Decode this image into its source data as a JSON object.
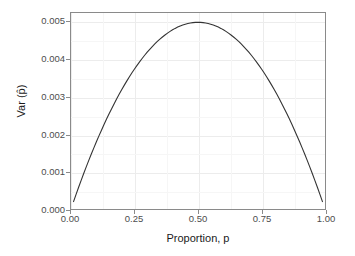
{
  "chart_data": {
    "type": "line",
    "title": "",
    "subtitle": "",
    "xlabel": "Proportion, p",
    "ylabel": "Var (p̂)",
    "xlim": [
      0.0,
      1.0
    ],
    "ylim": [
      0.0,
      0.00525
    ],
    "xticks": [
      0.0,
      0.25,
      0.5,
      0.75,
      1.0
    ],
    "xticklabels": [
      "0.00",
      "0.25",
      "0.50",
      "0.75",
      "1.00"
    ],
    "yticks": [
      0.0,
      0.001,
      0.002,
      0.003,
      0.004,
      0.005
    ],
    "yticklabels": [
      "0.000",
      "0.001",
      "0.002",
      "0.003",
      "0.004",
      "0.005"
    ],
    "grid": true,
    "legend": "none",
    "series": [
      {
        "name": "Var(p-hat) = p(1-p)/n, n = 50",
        "color": "#333333",
        "linewidth": 1.1,
        "x": [
          0.01,
          0.02,
          0.03,
          0.04,
          0.05,
          0.06,
          0.07,
          0.08,
          0.09,
          0.1,
          0.11,
          0.12,
          0.13,
          0.14,
          0.15,
          0.16,
          0.17,
          0.18,
          0.19,
          0.2,
          0.21,
          0.22,
          0.23,
          0.24,
          0.25,
          0.26,
          0.27,
          0.28,
          0.29,
          0.3,
          0.31,
          0.32,
          0.33,
          0.34,
          0.35,
          0.36,
          0.37,
          0.38,
          0.39,
          0.4,
          0.41,
          0.42,
          0.43,
          0.44,
          0.45,
          0.46,
          0.47,
          0.48,
          0.49,
          0.5,
          0.51,
          0.52,
          0.53,
          0.54,
          0.55,
          0.56,
          0.57,
          0.58,
          0.59,
          0.6,
          0.61,
          0.62,
          0.63,
          0.64,
          0.65,
          0.66,
          0.67,
          0.68,
          0.69,
          0.7,
          0.71,
          0.72,
          0.73,
          0.74,
          0.75,
          0.76,
          0.77,
          0.78,
          0.79,
          0.8,
          0.81,
          0.82,
          0.83,
          0.84,
          0.85,
          0.86,
          0.87,
          0.88,
          0.89,
          0.9,
          0.91,
          0.92,
          0.93,
          0.94,
          0.95,
          0.96,
          0.97,
          0.98,
          0.99
        ],
        "y": [
          0.000198,
          0.000392,
          0.000582,
          0.000768,
          0.00095,
          0.001128,
          0.001302,
          0.001472,
          0.001638,
          0.0018,
          0.001958,
          0.002112,
          0.002262,
          0.002408,
          0.00255,
          0.002688,
          0.002822,
          0.002952,
          0.003078,
          0.0032,
          0.003318,
          0.003432,
          0.003542,
          0.003648,
          0.00375,
          0.003848,
          0.003942,
          0.004032,
          0.004118,
          0.0042,
          0.004278,
          0.004352,
          0.004422,
          0.004488,
          0.00455,
          0.004608,
          0.004662,
          0.004712,
          0.004758,
          0.0048,
          0.004838,
          0.004872,
          0.004902,
          0.004928,
          0.00495,
          0.004968,
          0.004982,
          0.004992,
          0.004998,
          0.005,
          0.004998,
          0.004992,
          0.004982,
          0.004968,
          0.00495,
          0.004928,
          0.004902,
          0.004872,
          0.004838,
          0.0048,
          0.004758,
          0.004712,
          0.004662,
          0.004608,
          0.00455,
          0.004488,
          0.004422,
          0.004352,
          0.004278,
          0.0042,
          0.004118,
          0.004032,
          0.003942,
          0.003848,
          0.00375,
          0.003648,
          0.003542,
          0.003432,
          0.003318,
          0.0032,
          0.003078,
          0.002952,
          0.002822,
          0.002688,
          0.00255,
          0.002408,
          0.002262,
          0.002112,
          0.001958,
          0.0018,
          0.001638,
          0.001472,
          0.001302,
          0.001128,
          0.00095,
          0.000768,
          0.000582,
          0.000392,
          0.000198
        ]
      }
    ],
    "annotations": {
      "peak_x": 0.5,
      "peak_y": 0.005
    }
  },
  "style": {
    "panel_background": "#ffffff",
    "panel_border": "#8a8a8a",
    "grid_major_color": "#ececec",
    "grid_minor_color": "#f6f6f6",
    "axis_text_color": "#4d4d4d",
    "axis_title_color": "#1a1a1a",
    "line_color": "#333333"
  }
}
